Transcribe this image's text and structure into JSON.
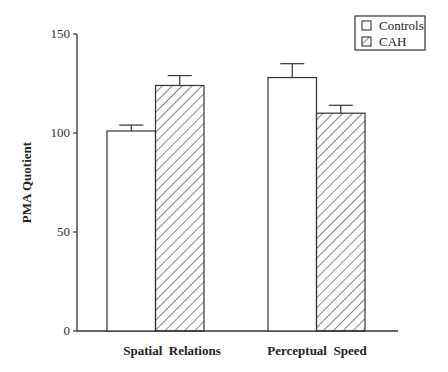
{
  "chart_data": {
    "type": "bar",
    "title": "",
    "xlabel": "",
    "ylabel": "PMA Quotient",
    "ylim": [
      0,
      150
    ],
    "yticks": [
      0,
      50,
      100,
      150
    ],
    "grid": false,
    "legend_position": "top-right",
    "categories": [
      "Spatial  Relations",
      "Perceptual  Speed"
    ],
    "series": [
      {
        "name": "Controls",
        "fill": "white",
        "values": [
          101,
          128
        ],
        "error": [
          3,
          7
        ]
      },
      {
        "name": "CAH",
        "fill": "hatched",
        "values": [
          124,
          110
        ],
        "error": [
          5,
          4
        ]
      }
    ]
  },
  "legend": {
    "items": [
      "Controls",
      "CAH"
    ]
  }
}
